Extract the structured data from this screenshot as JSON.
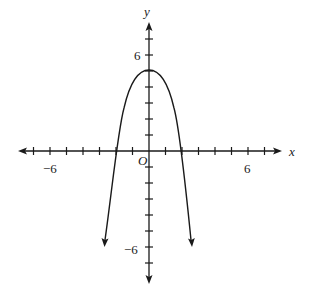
{
  "chart_data": {
    "type": "line",
    "title": "",
    "xlabel": "x",
    "ylabel": "y",
    "origin_label": "O",
    "xlim": [
      -8,
      8
    ],
    "ylim": [
      -8,
      8
    ],
    "x_tick_step": 1,
    "y_tick_step": 1,
    "x_tick_labels": [
      {
        "value": -6,
        "label": "−6"
      },
      {
        "value": 6,
        "label": "6"
      }
    ],
    "y_tick_labels": [
      {
        "value": 6,
        "label": "6"
      },
      {
        "value": -6,
        "label": "−6"
      }
    ],
    "grid": false,
    "series": [
      {
        "name": "curve",
        "description": "downward-opening parabola-like curve, vertex at (0,5), x-intercepts near (-2,0) and (2,0), arrows continuing downward",
        "points": [
          [
            -2.65,
            -5.8
          ],
          [
            -2,
            0
          ],
          [
            -1,
            3.9
          ],
          [
            0,
            5
          ],
          [
            1,
            3.9
          ],
          [
            2,
            0
          ],
          [
            2.6,
            -5.8
          ]
        ]
      }
    ]
  },
  "labels": {
    "x_axis": "x",
    "y_axis": "y",
    "origin": "O",
    "x_neg6": "−6",
    "x_pos6": "6",
    "y_pos6": "6",
    "y_neg6": "−6"
  }
}
